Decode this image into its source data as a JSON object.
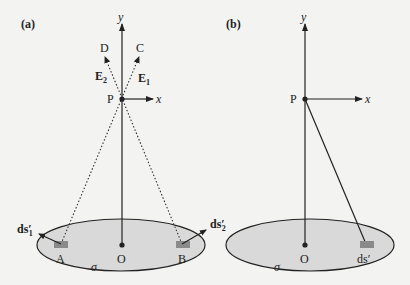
{
  "figure": {
    "panels": [
      {
        "id": "a",
        "label": "(a)",
        "axis_y": "y",
        "axis_x": "x",
        "point_p": "P",
        "origin": "O",
        "surface_label": "σ",
        "point_a": "A",
        "point_b": "B",
        "point_c": "C",
        "point_d": "D",
        "field_e1": "E",
        "field_e1_sub": "1",
        "field_e2": "E",
        "field_e2_sub": "2",
        "element_1": "ds",
        "element_1_prime": "′",
        "element_1_sub": "1",
        "element_2": "ds",
        "element_2_prime": "′",
        "element_2_sub": "2"
      },
      {
        "id": "b",
        "label": "(b)",
        "axis_y": "y",
        "axis_x": "x",
        "point_p": "P",
        "origin": "O",
        "surface_label": "σ",
        "element": "ds",
        "element_prime": "′"
      }
    ],
    "colors": {
      "background": "#f3f3f2",
      "surface_fill": "#d9d9d9",
      "surface_stroke": "#222222",
      "patch_fill": "#8a8a8a",
      "line": "#222222"
    }
  }
}
